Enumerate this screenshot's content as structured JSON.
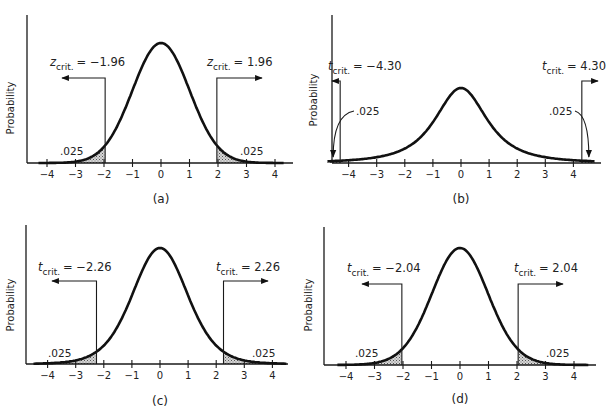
{
  "chart_data": [
    {
      "type": "area",
      "panel_label": "(a)",
      "distribution": "standard normal (z)",
      "ylabel": "Probability",
      "xlabel": "",
      "x_ticks": [
        -4,
        -3,
        -2,
        -1,
        0,
        1,
        2,
        3,
        4
      ],
      "x_tick_labels": [
        "−4",
        "−3",
        "−2",
        "−1",
        "0",
        "1",
        "2",
        "3",
        "4"
      ],
      "critical_values": [
        -1.96,
        1.96
      ],
      "critical_labels": {
        "symbol": "z",
        "subscript": "crit.",
        "left": "= −1.96",
        "right": "= 1.96"
      },
      "tail_areas": [
        0.025,
        0.025
      ],
      "tail_labels": [
        ".025",
        ".025"
      ],
      "df": null,
      "grid": false
    },
    {
      "type": "area",
      "panel_label": "(b)",
      "distribution": "t",
      "ylabel": "Probability",
      "xlabel": "",
      "x_ticks": [
        -4,
        -3,
        -2,
        -1,
        0,
        1,
        2,
        3,
        4
      ],
      "x_tick_labels": [
        "−4",
        "−3",
        "−2",
        "−1",
        "0",
        "1",
        "2",
        "3",
        "4"
      ],
      "critical_values": [
        -4.3,
        4.3
      ],
      "critical_labels": {
        "symbol": "t",
        "subscript": "crit.",
        "left": "= −4.30",
        "right": "= 4.30"
      },
      "tail_areas": [
        0.025,
        0.025
      ],
      "tail_labels": [
        ".025",
        ".025"
      ],
      "df": 2,
      "grid": false
    },
    {
      "type": "area",
      "panel_label": "(c)",
      "distribution": "t",
      "ylabel": "Probability",
      "xlabel": "",
      "x_ticks": [
        -4,
        -3,
        -2,
        -1,
        0,
        1,
        2,
        3,
        4
      ],
      "x_tick_labels": [
        "−4",
        "−3",
        "−2",
        "−1",
        "0",
        "1",
        "2",
        "3",
        "4"
      ],
      "critical_values": [
        -2.26,
        2.26
      ],
      "critical_labels": {
        "symbol": "t",
        "subscript": "crit.",
        "left": "= −2.26",
        "right": "= 2.26"
      },
      "tail_areas": [
        0.025,
        0.025
      ],
      "tail_labels": [
        ".025",
        ".025"
      ],
      "df": 9,
      "grid": false
    },
    {
      "type": "area",
      "panel_label": "(d)",
      "distribution": "t",
      "ylabel": "Probability",
      "xlabel": "",
      "x_ticks": [
        -4,
        -3,
        -2,
        -1,
        0,
        1,
        2,
        3,
        4
      ],
      "x_tick_labels": [
        "−4",
        "−3",
        "−2",
        "−1",
        "0",
        "1",
        "2",
        "3",
        "4"
      ],
      "critical_values": [
        -2.04,
        2.04
      ],
      "critical_labels": {
        "symbol": "t",
        "subscript": "crit.",
        "left": "= −2.04",
        "right": "= 2.04"
      },
      "tail_areas": [
        0.025,
        0.025
      ],
      "tail_labels": [
        ".025",
        ".025"
      ],
      "df": 30,
      "grid": false
    }
  ],
  "panels": [
    {
      "id": "a",
      "label": "(a)",
      "ylabel": "Probability",
      "crit_symbol": "z",
      "crit_sub": "crit.",
      "left_val": "= −1.96",
      "right_val": "= 1.96",
      "tail_left": ".025",
      "tail_right": ".025"
    },
    {
      "id": "b",
      "label": "(b)",
      "ylabel": "Probability",
      "crit_symbol": "t",
      "crit_sub": "crit.",
      "left_val": "= −4.30",
      "right_val": "= 4.30",
      "tail_left": ".025",
      "tail_right": ".025"
    },
    {
      "id": "c",
      "label": "(c)",
      "ylabel": "Probability",
      "crit_symbol": "t",
      "crit_sub": "crit.",
      "left_val": "= −2.26",
      "right_val": "= 2.26",
      "tail_left": ".025",
      "tail_right": ".025"
    },
    {
      "id": "d",
      "label": "(d)",
      "ylabel": "Probability",
      "crit_symbol": "t",
      "crit_sub": "crit.",
      "left_val": "= −2.04",
      "right_val": "= 2.04",
      "tail_left": ".025",
      "tail_right": ".025"
    }
  ],
  "ticks": [
    "−4",
    "−3",
    "−2",
    "−1",
    "0",
    "1",
    "2",
    "3",
    "4"
  ]
}
